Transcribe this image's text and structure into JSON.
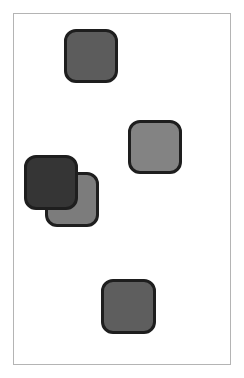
{
  "canvas": {
    "border_color": "#b4b4b4",
    "background": "#ffffff"
  },
  "tiles": [
    {
      "id": "tile-1",
      "x": 64,
      "y": 29,
      "w": 54,
      "h": 54,
      "fill": "#5c5c5c",
      "z": 1
    },
    {
      "id": "tile-2",
      "x": 128,
      "y": 120,
      "w": 54,
      "h": 54,
      "fill": "#838383",
      "z": 1
    },
    {
      "id": "tile-4",
      "x": 45,
      "y": 172,
      "w": 54,
      "h": 55,
      "fill": "#7c7c7c",
      "z": 1
    },
    {
      "id": "tile-3",
      "x": 24,
      "y": 155,
      "w": 54,
      "h": 55,
      "fill": "#353535",
      "z": 2
    },
    {
      "id": "tile-5",
      "x": 101,
      "y": 279,
      "w": 55,
      "h": 55,
      "fill": "#5e5e5e",
      "z": 1
    }
  ],
  "tile_border_color": "#1e1e1e"
}
